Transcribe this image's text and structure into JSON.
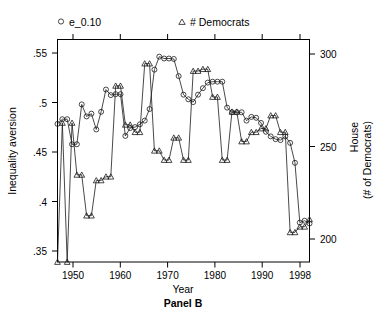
{
  "chart_data": {
    "type": "line",
    "title": "Panel B",
    "xlabel": "Year",
    "ylabel": "Inequality aversion",
    "y2label": "House\n(# of Democrats)",
    "xlim": [
      1946,
      1998
    ],
    "ylim": [
      0.335,
      0.575
    ],
    "y2lim": [
      188,
      308
    ],
    "grid": false,
    "legend_position": "top",
    "xticks": [
      1950,
      1960,
      1970,
      1980,
      1990,
      1998
    ],
    "xticklabels": [
      "1950",
      "1960",
      "1970",
      "1980",
      "1990",
      "1998"
    ],
    "yticks": [
      0.35,
      0.4,
      0.45,
      0.5,
      0.55
    ],
    "yticklabels": [
      ".35",
      ".4",
      ".45",
      ".5",
      ".55"
    ],
    "y2ticks": [
      200,
      250,
      300
    ],
    "y2ticklabels": [
      "200",
      "250",
      "300"
    ],
    "x": [
      1946,
      1947,
      1948,
      1949,
      1950,
      1951,
      1952,
      1953,
      1954,
      1955,
      1956,
      1957,
      1958,
      1959,
      1960,
      1961,
      1962,
      1963,
      1964,
      1965,
      1966,
      1967,
      1968,
      1969,
      1970,
      1971,
      1972,
      1973,
      1974,
      1975,
      1976,
      1977,
      1978,
      1979,
      1980,
      1981,
      1982,
      1983,
      1984,
      1985,
      1986,
      1987,
      1988,
      1989,
      1990,
      1991,
      1992,
      1993,
      1994,
      1995,
      1996,
      1997,
      1998
    ],
    "series": [
      {
        "name": "e_0.10",
        "marker": "circle",
        "axis": "left",
        "values": [
          0.484,
          0.489,
          0.489,
          0.462,
          0.462,
          0.505,
          0.492,
          0.495,
          0.478,
          0.497,
          0.521,
          0.515,
          0.516,
          0.516,
          0.471,
          0.4795,
          0.4805,
          0.4835,
          0.4875,
          0.5,
          0.5425,
          0.5565,
          0.5545,
          0.5545,
          0.554,
          0.5355,
          0.5155,
          0.5105,
          0.5075,
          0.5155,
          0.5225,
          0.5285,
          0.5295,
          0.5295,
          0.5295,
          0.5015,
          0.4965,
          0.4965,
          0.4965,
          0.4875,
          0.4915,
          0.4905,
          0.485,
          0.4755,
          0.4705,
          0.4675,
          0.4665,
          0.4705,
          0.4635,
          0.442,
          0.3775,
          0.3795,
          0.3765
        ],
        "marker_values": [
          0.484,
          0.489,
          0.489,
          0.462,
          0.462,
          0.505,
          0.492,
          0.495,
          0.478,
          0.497,
          0.521,
          0.515,
          0.516,
          0.516,
          0.471,
          0.4795,
          0.4805,
          0.4835,
          0.4875,
          0.5,
          0.5425,
          0.5565,
          0.5545,
          0.5545,
          0.554,
          0.5355,
          0.5155,
          0.5105,
          0.5075,
          0.5155,
          0.5225,
          0.5285,
          0.5295,
          0.5295,
          0.5295,
          0.5015,
          0.4965,
          0.4965,
          0.4965,
          0.4875,
          0.4915,
          0.4905,
          0.485,
          0.4755,
          0.4705,
          0.4675,
          0.4665,
          0.4705,
          0.4635,
          0.442,
          0.3775,
          0.3795,
          0.3765
        ]
      },
      {
        "name": "# Democrats",
        "marker": "triangle",
        "axis": "right",
        "values": [
          188,
          263,
          188,
          263,
          235,
          235,
          213,
          213,
          232,
          232,
          234,
          234,
          283,
          283,
          262,
          262,
          258,
          258,
          295,
          295,
          248,
          248,
          243,
          243,
          255,
          255,
          243,
          243,
          291,
          291,
          292,
          292,
          277,
          277,
          243,
          243,
          269,
          269,
          253,
          253,
          258,
          258,
          260,
          260,
          267,
          267,
          258,
          258,
          204,
          204,
          207,
          207,
          211
        ]
      }
    ],
    "legend": [
      {
        "label": "e_0.10",
        "marker": "circle"
      },
      {
        "label": "# Democrats",
        "marker": "triangle"
      }
    ]
  },
  "axes": {
    "left_title": "Inequality aversion",
    "right_title_line1": "House",
    "right_title_line2": "(# of Democrats)",
    "x_title": "Year"
  },
  "panel": {
    "title": "Panel B"
  },
  "colors": {
    "ink": "#000000",
    "series": "#1a1a1a",
    "background": "#ffffff"
  }
}
